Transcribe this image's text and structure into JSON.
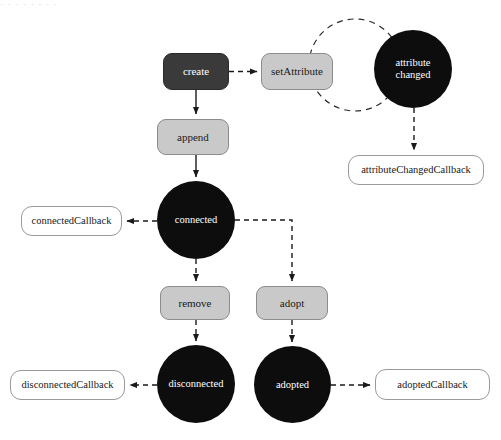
{
  "page": {
    "top_fragment": "· · · · · · · ·",
    "background_color": "#ffffff"
  },
  "palette": {
    "dark_node": "#3a3a3a",
    "gray_node": "#c9c9c9",
    "black_state": "#0d0d0d",
    "plain_border": "#9a9a9a",
    "edge": "#1a1a1a",
    "loop": "#2b2b2b"
  },
  "nodes": [
    {
      "id": "create",
      "label": "create",
      "shape": "rounded-rect",
      "style": "dark",
      "x": 163,
      "y": 53,
      "w": 66,
      "h": 37
    },
    {
      "id": "setattribute",
      "label": "setAttribute",
      "shape": "rounded-rect",
      "style": "gray",
      "x": 261,
      "y": 53,
      "w": 72,
      "h": 37
    },
    {
      "id": "attribute-changed",
      "label": "attribute\nchanged",
      "shape": "circle",
      "style": "black",
      "x": 374,
      "y": 30,
      "w": 78,
      "h": 78
    },
    {
      "id": "attributechangedcallback",
      "label": "attributeChangedCallback",
      "shape": "rounded-rect",
      "style": "plain",
      "x": 348,
      "y": 155,
      "w": 136,
      "h": 30
    },
    {
      "id": "append",
      "label": "append",
      "shape": "rounded-rect",
      "style": "gray",
      "x": 157,
      "y": 119,
      "w": 72,
      "h": 36
    },
    {
      "id": "connected",
      "label": "connected",
      "shape": "circle",
      "style": "black",
      "x": 157,
      "y": 181,
      "w": 78,
      "h": 78
    },
    {
      "id": "connectedcallback",
      "label": "connectedCallback",
      "shape": "rounded-rect",
      "style": "plain",
      "x": 21,
      "y": 206,
      "w": 101,
      "h": 30
    },
    {
      "id": "remove",
      "label": "remove",
      "shape": "rounded-rect",
      "style": "gray",
      "x": 160,
      "y": 286,
      "w": 70,
      "h": 34
    },
    {
      "id": "adopt",
      "label": "adopt",
      "shape": "rounded-rect",
      "style": "gray",
      "x": 256,
      "y": 286,
      "w": 72,
      "h": 34
    },
    {
      "id": "disconnected",
      "label": "disconnected",
      "shape": "circle",
      "style": "black",
      "x": 157,
      "y": 345,
      "w": 78,
      "h": 78
    },
    {
      "id": "adopted",
      "label": "adopted",
      "shape": "circle",
      "style": "black",
      "x": 254,
      "y": 346,
      "w": 77,
      "h": 77
    },
    {
      "id": "disconnectedcallback",
      "label": "disconnectedCallback",
      "shape": "rounded-rect",
      "style": "plain",
      "x": 10,
      "y": 370,
      "w": 115,
      "h": 30
    },
    {
      "id": "adoptedcallback",
      "label": "adoptedCallback",
      "shape": "rounded-rect",
      "style": "plain",
      "x": 375,
      "y": 369,
      "w": 115,
      "h": 31
    }
  ],
  "edges": [
    {
      "id": "create-to-setattribute",
      "from": "create",
      "to": "setattribute",
      "line": "dashed",
      "arrow": true
    },
    {
      "id": "create-to-append",
      "from": "create",
      "to": "append",
      "line": "solid",
      "arrow": true
    },
    {
      "id": "append-to-connected",
      "from": "append",
      "to": "connected",
      "line": "solid",
      "arrow": true
    },
    {
      "id": "attributechanged-to-callback",
      "from": "attribute-changed",
      "to": "attributechangedcallback",
      "line": "dashed",
      "arrow": true
    },
    {
      "id": "attributechanged-self-loop",
      "from": "attribute-changed",
      "to": "setattribute",
      "line": "dashed",
      "arrow": false
    },
    {
      "id": "connected-to-connectedcallback",
      "from": "connected",
      "to": "connectedcallback",
      "line": "dashed",
      "arrow": true
    },
    {
      "id": "connected-to-remove",
      "from": "connected",
      "to": "remove",
      "line": "dashed",
      "arrow": true
    },
    {
      "id": "connected-to-adopt",
      "from": "connected",
      "to": "adopt",
      "line": "dashed",
      "arrow": true
    },
    {
      "id": "remove-to-disconnected",
      "from": "remove",
      "to": "disconnected",
      "line": "dashed",
      "arrow": true
    },
    {
      "id": "adopt-to-adopted",
      "from": "adopt",
      "to": "adopted",
      "line": "dashed",
      "arrow": true
    },
    {
      "id": "disconnected-to-disconnectedcallback",
      "from": "disconnected",
      "to": "disconnectedcallback",
      "line": "dashed",
      "arrow": true
    },
    {
      "id": "adopted-to-adoptedcallback",
      "from": "adopted",
      "to": "adoptedcallback",
      "line": "dashed",
      "arrow": true
    }
  ]
}
